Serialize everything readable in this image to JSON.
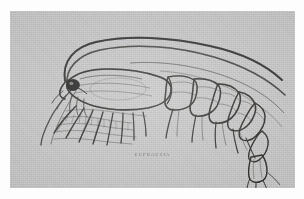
{
  "figure": {
    "kind": "scientific-illustration",
    "caption": "EUPHAUSIA",
    "medium": "halftone engraving plate",
    "background_color": "#c9c9c9",
    "ink_color": "#33312f",
    "page_color": "#fdfdfd",
    "plate": {
      "x": 10,
      "y": 11,
      "width": 285,
      "height": 177
    }
  },
  "anatomy": {
    "parts": [
      {
        "name": "antenna-upper-long",
        "label": "first antenna (long flagellum)"
      },
      {
        "name": "antenna-lower-long",
        "label": "second antenna (long flagellum)"
      },
      {
        "name": "antenna-short-ventral",
        "label": "antennule, ventral branch"
      },
      {
        "name": "eye",
        "label": "compound eye"
      },
      {
        "name": "rostrum",
        "label": "rostrum"
      },
      {
        "name": "carapace",
        "label": "carapace"
      },
      {
        "name": "thoracic-legs",
        "label": "thoracopods (feathery)"
      },
      {
        "name": "abdomen-segments",
        "label": "abdominal somites"
      },
      {
        "name": "pleopods",
        "label": "pleopods"
      },
      {
        "name": "telson-uropods",
        "label": "telson and uropods (tail fan)"
      }
    ],
    "abdominal_segment_count": 6
  }
}
